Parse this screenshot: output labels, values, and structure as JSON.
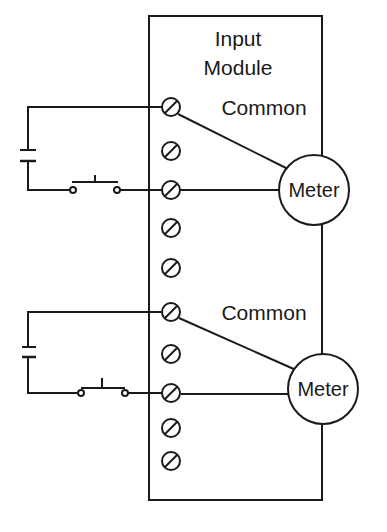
{
  "module": {
    "title_line1": "Input",
    "title_line2": "Module"
  },
  "circuits": [
    {
      "common_label": "Common",
      "meter_label": "Meter",
      "switch_type": "normally-open pushbutton"
    },
    {
      "common_label": "Common",
      "meter_label": "Meter",
      "switch_type": "normally-closed pushbutton"
    }
  ],
  "terminal_count": 10,
  "colors": {
    "line": "#1a1a1a",
    "background": "#ffffff"
  }
}
